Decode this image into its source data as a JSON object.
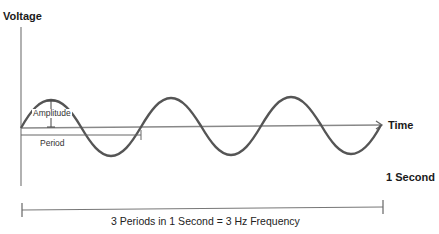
{
  "diagram": {
    "y_axis_label": "Voltage",
    "x_axis_label": "Time",
    "amplitude_label": "Amplitude",
    "period_label": "Period",
    "duration_label": "1 Second",
    "caption": "3 Periods in 1 Second = 3 Hz Frequency",
    "periods": 3,
    "frequency_hz": 3,
    "colors": {
      "wave": "#555555",
      "axis": "#888888",
      "text": "#1a1a1a"
    }
  }
}
